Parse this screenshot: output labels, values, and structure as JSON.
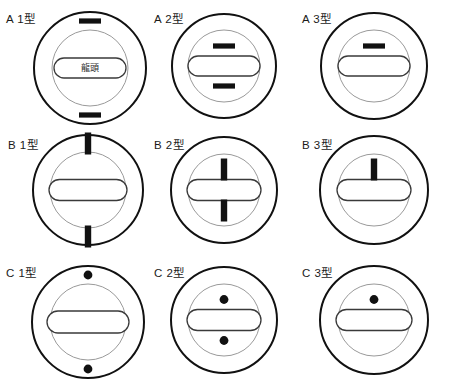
{
  "figure": {
    "title": "",
    "background_color": "#ffffff",
    "outer_circle_color": "#111111",
    "inner_circle_color": "#9a9a9a",
    "slot_color": "#3a3a3a",
    "marker_color": "#111111",
    "columns": 3,
    "rows": 3
  },
  "cells": [
    {
      "id": "a1",
      "label_letter": "A",
      "label_number": "1",
      "label_suffix": "型",
      "label": "A 1型",
      "slot_text": "龍頭",
      "marker_shape": "horizontal-bar",
      "marker_count": 2,
      "marker_zone": "outer-ring",
      "marker_positions": [
        "top",
        "bottom"
      ]
    },
    {
      "id": "a2",
      "label_letter": "A",
      "label_number": "2",
      "label_suffix": "型",
      "label": "A 2型",
      "slot_text": "",
      "marker_shape": "horizontal-bar",
      "marker_count": 2,
      "marker_zone": "inner-circle",
      "marker_positions": [
        "top",
        "bottom"
      ]
    },
    {
      "id": "a3",
      "label_letter": "A",
      "label_number": "3",
      "label_suffix": "型",
      "label": "A 3型",
      "slot_text": "",
      "marker_shape": "horizontal-bar",
      "marker_count": 1,
      "marker_zone": "inner-circle",
      "marker_positions": [
        "top"
      ]
    },
    {
      "id": "b1",
      "label_letter": "B",
      "label_number": "1",
      "label_suffix": "型",
      "label": "B 1型",
      "slot_text": "",
      "marker_shape": "vertical-bar",
      "marker_count": 2,
      "marker_zone": "outer-ring",
      "marker_positions": [
        "top",
        "bottom"
      ]
    },
    {
      "id": "b2",
      "label_letter": "B",
      "label_number": "2",
      "label_suffix": "型",
      "label": "B 2型",
      "slot_text": "",
      "marker_shape": "vertical-bar",
      "marker_count": 2,
      "marker_zone": "inner-circle",
      "marker_positions": [
        "top",
        "bottom"
      ]
    },
    {
      "id": "b3",
      "label_letter": "B",
      "label_number": "3",
      "label_suffix": "型",
      "label": "B 3型",
      "slot_text": "",
      "marker_shape": "vertical-bar",
      "marker_count": 1,
      "marker_zone": "inner-circle",
      "marker_positions": [
        "top"
      ]
    },
    {
      "id": "c1",
      "label_letter": "C",
      "label_number": "1",
      "label_suffix": "型",
      "label": "C 1型",
      "slot_text": "",
      "marker_shape": "dot",
      "marker_count": 2,
      "marker_zone": "outer-ring",
      "marker_positions": [
        "top",
        "bottom"
      ]
    },
    {
      "id": "c2",
      "label_letter": "C",
      "label_number": "2",
      "label_suffix": "型",
      "label": "C 2型",
      "slot_text": "",
      "marker_shape": "dot",
      "marker_count": 2,
      "marker_zone": "inner-circle",
      "marker_positions": [
        "top",
        "bottom"
      ]
    },
    {
      "id": "c3",
      "label_letter": "C",
      "label_number": "3",
      "label_suffix": "型",
      "label": "C 3型",
      "slot_text": "",
      "marker_shape": "dot",
      "marker_count": 1,
      "marker_zone": "inner-circle",
      "marker_positions": [
        "top"
      ]
    }
  ]
}
